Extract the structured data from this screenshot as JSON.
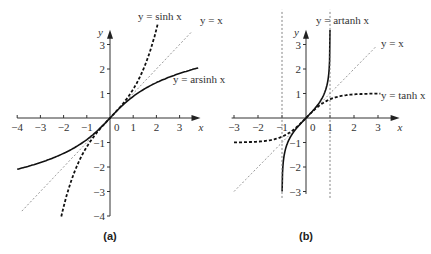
{
  "chart_data": [
    {
      "type": "line",
      "panel_label": "(a)",
      "xlabel": "x",
      "ylabel": "y",
      "xlim": [
        -4,
        3.8
      ],
      "ylim": [
        -4,
        3.8
      ],
      "x_ticks": [
        "−4",
        "−3",
        "−2",
        "−1",
        "0",
        "1",
        "2",
        "3"
      ],
      "y_ticks": [
        "3",
        "2",
        "1",
        "−1",
        "−2",
        "−3",
        "−4"
      ],
      "grid": false,
      "series": [
        {
          "name": "y = sinh x",
          "style": "dashed-bold",
          "x": [
            -2.1,
            -1.5,
            -1,
            -0.5,
            0,
            0.5,
            1,
            1.5,
            2.05
          ],
          "values": [
            -4.02,
            -2.13,
            -1.18,
            -0.52,
            0,
            0.52,
            1.18,
            2.13,
            3.82
          ]
        },
        {
          "name": "y = x",
          "style": "dotted-light",
          "x": [
            -3.8,
            3.5
          ],
          "values": [
            -3.8,
            3.5
          ]
        },
        {
          "name": "y = arsinh x",
          "style": "solid",
          "x": [
            -4,
            -3,
            -2,
            -1,
            0,
            1,
            2,
            3,
            3.8
          ],
          "values": [
            -2.09,
            -1.82,
            -1.44,
            -0.88,
            0,
            0.88,
            1.44,
            1.82,
            2.04
          ]
        }
      ],
      "annotations": [
        "y = sinh x",
        "y = x",
        "y = arsinh x"
      ]
    },
    {
      "type": "line",
      "panel_label": "(b)",
      "xlabel": "x",
      "ylabel": "y",
      "xlim": [
        -3,
        3.8
      ],
      "ylim": [
        -3,
        3.8
      ],
      "x_ticks": [
        "−3",
        "−2",
        "−1",
        "0",
        "1",
        "2",
        "3"
      ],
      "y_ticks": [
        "3",
        "2",
        "1",
        "−1",
        "−2",
        "−3"
      ],
      "grid": false,
      "series": [
        {
          "name": "y = artanh x",
          "style": "solid",
          "x": [
            -0.995,
            -0.9,
            -0.7,
            -0.5,
            0,
            0.5,
            0.7,
            0.9,
            0.998
          ],
          "values": [
            -2.99,
            -1.47,
            -0.87,
            -0.55,
            0,
            0.55,
            0.87,
            1.47,
            3.45
          ]
        },
        {
          "name": "y = x",
          "style": "dotted-light",
          "x": [
            -3,
            3
          ],
          "values": [
            -3,
            3
          ]
        },
        {
          "name": "y = tanh x",
          "style": "dashed-bold",
          "x": [
            -3,
            -2,
            -1,
            -0.5,
            0,
            0.5,
            1,
            2,
            3
          ],
          "values": [
            -0.995,
            -0.96,
            -0.76,
            -0.46,
            0,
            0.46,
            0.76,
            0.96,
            0.995
          ]
        },
        {
          "name": "asymptote x = -1",
          "style": "dotted-vertical",
          "x": [
            -1,
            -1
          ],
          "values": [
            -3,
            3.8
          ]
        },
        {
          "name": "asymptote x = 1",
          "style": "dotted-vertical",
          "x": [
            1,
            1
          ],
          "values": [
            -3,
            3.8
          ]
        }
      ],
      "annotations": [
        "y = artanh x",
        "y = x",
        "y = tanh x"
      ]
    }
  ],
  "panels": {
    "a": {
      "label": "(a)",
      "axis_x": "x",
      "axis_y": "y",
      "x_ticks": [
        {
          "v": -4,
          "t": "−4"
        },
        {
          "v": -3,
          "t": "−3"
        },
        {
          "v": -2,
          "t": "−2"
        },
        {
          "v": -1,
          "t": "−1"
        },
        {
          "v": 1,
          "t": "1"
        },
        {
          "v": 2,
          "t": "2"
        },
        {
          "v": 3,
          "t": "3"
        }
      ],
      "y_ticks": [
        {
          "v": 3,
          "t": "3"
        },
        {
          "v": 2,
          "t": "2"
        },
        {
          "v": 1,
          "t": "1"
        },
        {
          "v": -1,
          "t": "−1"
        },
        {
          "v": -2,
          "t": "−2"
        },
        {
          "v": -3,
          "t": "−3"
        },
        {
          "v": -4,
          "t": "−4"
        }
      ],
      "origin_label": "0",
      "labels": {
        "sinh": "y = sinh x",
        "identity": "y = x",
        "arsinh": "y = arsinh x"
      }
    },
    "b": {
      "label": "(b)",
      "axis_x": "x",
      "axis_y": "y",
      "x_ticks": [
        {
          "v": -3,
          "t": "−3"
        },
        {
          "v": -2,
          "t": "−2"
        },
        {
          "v": -1,
          "t": "−1"
        },
        {
          "v": 1,
          "t": "1"
        },
        {
          "v": 2,
          "t": "2"
        },
        {
          "v": 3,
          "t": "3"
        }
      ],
      "y_ticks": [
        {
          "v": 3,
          "t": "3"
        },
        {
          "v": 2,
          "t": "2"
        },
        {
          "v": 1,
          "t": "1"
        },
        {
          "v": -1,
          "t": "−1"
        },
        {
          "v": -2,
          "t": "−2"
        },
        {
          "v": -3,
          "t": "−3"
        }
      ],
      "origin_label": "0",
      "labels": {
        "artanh": "y = artanh x",
        "identity": "y = x",
        "tanh": "y = tanh x"
      }
    }
  }
}
